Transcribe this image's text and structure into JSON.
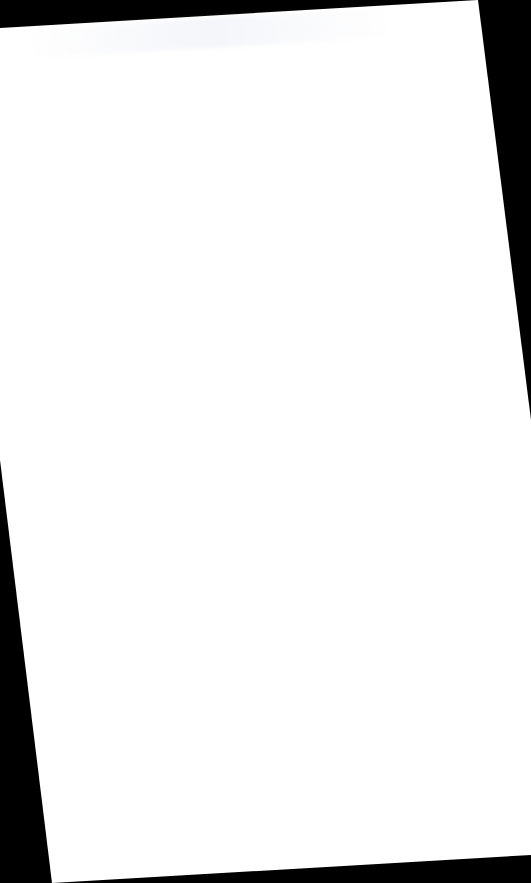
{
  "document": {
    "type": "scanned-page",
    "state": "blank",
    "rotation_deg": -3.4,
    "colors": {
      "background": "#000000",
      "page": "#ffffff",
      "bleed_through": "#e6e8f0"
    },
    "page_corners": {
      "top_left": [
        0,
        28
      ],
      "top_right": [
        478,
        0
      ],
      "bottom_right": [
        531,
        855
      ],
      "bottom_left": [
        52,
        883
      ]
    },
    "text": ""
  }
}
